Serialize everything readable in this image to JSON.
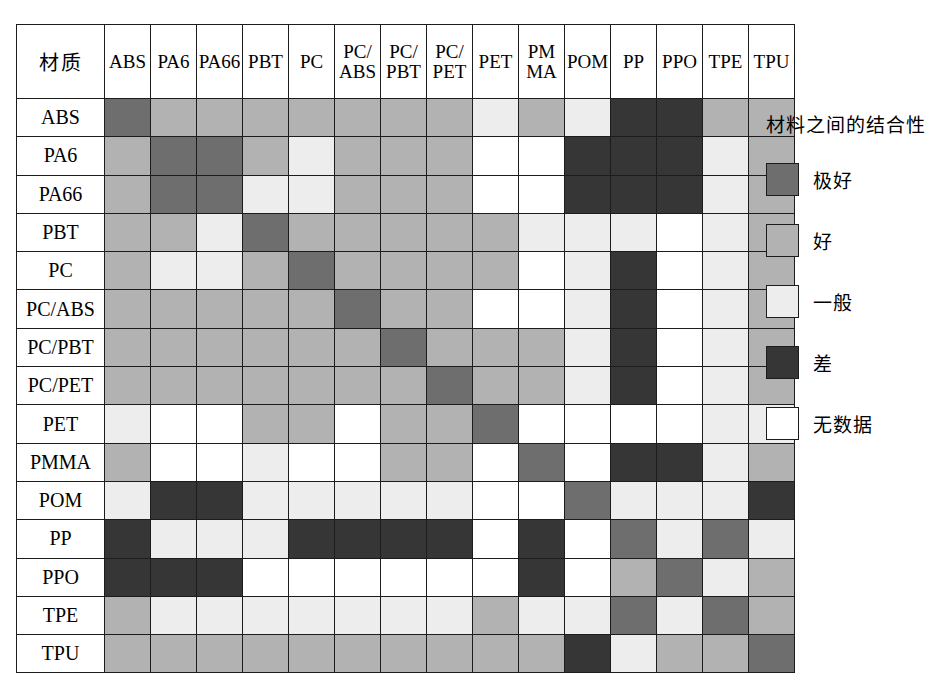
{
  "chart_data": {
    "type": "heatmap",
    "title": "",
    "corner_header": "材质",
    "xlabel": "",
    "ylabel": "",
    "grid": true,
    "legend_position": "right",
    "categories": [
      "ABS",
      "PA6",
      "PA66",
      "PBT",
      "PC",
      "PC/ABS",
      "PC/PBT",
      "PC/PET",
      "PET",
      "PMMA",
      "POM",
      "PP",
      "PPO",
      "TPE",
      "TPU"
    ],
    "column_headers": [
      [
        "ABS"
      ],
      [
        "PA6"
      ],
      [
        "PA66"
      ],
      [
        "PBT"
      ],
      [
        "PC"
      ],
      [
        "PC/",
        "ABS"
      ],
      [
        "PC/",
        "PBT"
      ],
      [
        "PC/",
        "PET"
      ],
      [
        "PET"
      ],
      [
        "PM",
        "MA"
      ],
      [
        "POM"
      ],
      [
        "PP"
      ],
      [
        "PPO"
      ],
      [
        "TPE"
      ],
      [
        "TPU"
      ]
    ],
    "row_headers": [
      "ABS",
      "PA6",
      "PA66",
      "PBT",
      "PC",
      "PC/ABS",
      "PC/PBT",
      "PC/PET",
      "PET",
      "PMMA",
      "POM",
      "PP",
      "PPO",
      "TPE",
      "TPU"
    ],
    "value_levels": [
      "excellent",
      "good",
      "fair",
      "poor",
      "nodata"
    ],
    "value_labels": {
      "excellent": "极好",
      "good": "好",
      "fair": "一般",
      "poor": "差",
      "nodata": "无数据"
    },
    "colors": {
      "excellent": "#6e6e6e",
      "good": "#b2b2b2",
      "fair": "#ededed",
      "poor": "#363636",
      "nodata": "#ffffff",
      "grid": "#1c1c1c"
    },
    "matrix": [
      [
        "excellent",
        "good",
        "good",
        "good",
        "good",
        "good",
        "good",
        "good",
        "fair",
        "good",
        "fair",
        "poor",
        "poor",
        "good",
        "good"
      ],
      [
        "good",
        "excellent",
        "excellent",
        "good",
        "fair",
        "good",
        "good",
        "good",
        "nodata",
        "nodata",
        "poor",
        "poor",
        "poor",
        "fair",
        "good"
      ],
      [
        "good",
        "excellent",
        "excellent",
        "fair",
        "fair",
        "good",
        "good",
        "good",
        "nodata",
        "nodata",
        "poor",
        "poor",
        "poor",
        "fair",
        "good"
      ],
      [
        "good",
        "good",
        "fair",
        "excellent",
        "good",
        "good",
        "good",
        "good",
        "good",
        "fair",
        "fair",
        "fair",
        "nodata",
        "fair",
        "good"
      ],
      [
        "good",
        "fair",
        "fair",
        "good",
        "excellent",
        "good",
        "good",
        "good",
        "good",
        "nodata",
        "fair",
        "poor",
        "nodata",
        "fair",
        "good"
      ],
      [
        "good",
        "good",
        "good",
        "good",
        "good",
        "excellent",
        "good",
        "good",
        "nodata",
        "nodata",
        "fair",
        "poor",
        "nodata",
        "fair",
        "good"
      ],
      [
        "good",
        "good",
        "good",
        "good",
        "good",
        "good",
        "excellent",
        "good",
        "good",
        "good",
        "fair",
        "poor",
        "nodata",
        "fair",
        "good"
      ],
      [
        "good",
        "good",
        "good",
        "good",
        "good",
        "good",
        "good",
        "excellent",
        "good",
        "good",
        "fair",
        "poor",
        "nodata",
        "fair",
        "good"
      ],
      [
        "fair",
        "nodata",
        "nodata",
        "good",
        "good",
        "nodata",
        "good",
        "good",
        "excellent",
        "nodata",
        "nodata",
        "nodata",
        "nodata",
        "fair",
        "fair"
      ],
      [
        "good",
        "nodata",
        "nodata",
        "fair",
        "nodata",
        "nodata",
        "good",
        "good",
        "nodata",
        "excellent",
        "nodata",
        "poor",
        "poor",
        "fair",
        "good"
      ],
      [
        "fair",
        "poor",
        "poor",
        "fair",
        "fair",
        "fair",
        "fair",
        "fair",
        "nodata",
        "nodata",
        "excellent",
        "fair",
        "fair",
        "fair",
        "poor"
      ],
      [
        "poor",
        "fair",
        "fair",
        "fair",
        "poor",
        "poor",
        "poor",
        "poor",
        "nodata",
        "poor",
        "nodata",
        "excellent",
        "fair",
        "excellent",
        "fair"
      ],
      [
        "poor",
        "poor",
        "poor",
        "nodata",
        "nodata",
        "nodata",
        "nodata",
        "nodata",
        "nodata",
        "poor",
        "nodata",
        "good",
        "excellent",
        "fair",
        "good"
      ],
      [
        "good",
        "fair",
        "fair",
        "fair",
        "fair",
        "fair",
        "fair",
        "fair",
        "good",
        "fair",
        "fair",
        "excellent",
        "fair",
        "excellent",
        "good"
      ],
      [
        "good",
        "good",
        "good",
        "good",
        "good",
        "good",
        "good",
        "good",
        "good",
        "good",
        "poor",
        "fair",
        "good",
        "good",
        "excellent"
      ]
    ]
  },
  "legend": {
    "title": "材料之间的结合性",
    "items": [
      {
        "key": "excellent",
        "label": "极好"
      },
      {
        "key": "good",
        "label": "好"
      },
      {
        "key": "fair",
        "label": "一般"
      },
      {
        "key": "poor",
        "label": "差"
      },
      {
        "key": "nodata",
        "label": "无数据"
      }
    ]
  }
}
